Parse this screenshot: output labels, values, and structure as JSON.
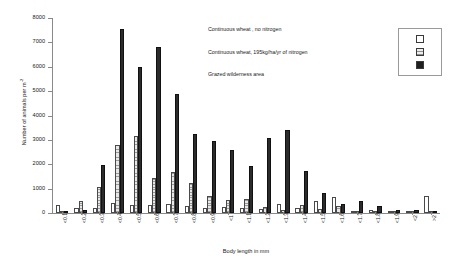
{
  "chart_data": {
    "type": "bar",
    "title": "",
    "xlabel": "Body length in mm",
    "ylabel": "Number of animals per m",
    "ylabel_exponent": "-2",
    "ylim": [
      0,
      8000
    ],
    "ytick_step": 1000,
    "yticks": [
      "8000",
      "7000",
      "6000",
      "5000",
      "4000",
      "3000",
      "2000",
      "1000",
      "0"
    ],
    "grid": false,
    "legend_position": "inside-upper-right",
    "categories": [
      "<0.1",
      "<0.2",
      "<0.3",
      "<0.4",
      "<0.5",
      "<0.6",
      "<0.7",
      "<0.8",
      "<0.9",
      "<1",
      "<1.1",
      "<1.2",
      "<1.3",
      "<1.4",
      "<1.5",
      "<1.6",
      "<1.7",
      "<1.8",
      "<1.9",
      "<2",
      ">2"
    ],
    "series": [
      {
        "name": "Continuous wheat , no nitrogen",
        "key": "s0",
        "values": [
          330,
          200,
          220,
          400,
          340,
          330,
          380,
          300,
          220,
          250,
          200,
          170,
          380,
          200,
          480,
          650,
          60,
          110,
          80,
          40,
          700
        ]
      },
      {
        "name": "Continuous wheat, 195kg/ha/yr of nitrogen",
        "key": "s1",
        "values": [
          60,
          480,
          1050,
          2800,
          3150,
          1450,
          1700,
          1250,
          680,
          520,
          560,
          240,
          120,
          320,
          160,
          300,
          60,
          90,
          40,
          30,
          60
        ]
      },
      {
        "name": "Grazed wilderness area",
        "key": "s2",
        "values": [
          90,
          130,
          1950,
          7550,
          6000,
          6800,
          4880,
          3250,
          2950,
          2580,
          1930,
          3080,
          3420,
          1720,
          830,
          350,
          480,
          300,
          120,
          140,
          70
        ]
      }
    ]
  },
  "legend": {
    "entries": [
      {
        "label": "Continuous wheat , no nitrogen",
        "key": "s0"
      },
      {
        "label": "Continuous wheat, 195kg/ha/yr of nitrogen",
        "key": "s1"
      },
      {
        "label": "Grazed wilderness area",
        "key": "s2"
      }
    ]
  },
  "colors": {
    "series_no_nitrogen": "#ffffff",
    "series_with_nitrogen": "#e8e8e8",
    "series_grazed": "#2b2b2b",
    "axis": "#8a8a8a",
    "text": "#1a1a1a",
    "background": "#ffffff"
  }
}
